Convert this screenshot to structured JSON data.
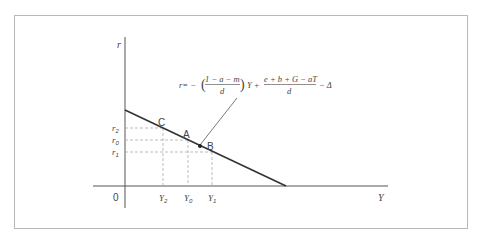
{
  "diagram": {
    "axes": {
      "y_label": "r",
      "x_label": "Y",
      "origin_label": "0"
    },
    "points": {
      "C": "C",
      "A": "A",
      "B": "B"
    },
    "y_ticks": [
      "r2",
      "r0",
      "r1"
    ],
    "y_ticks_display": {
      "r2_base": "r",
      "r2_sub": "2",
      "r0_base": "r",
      "r0_sub": "0",
      "r1_base": "r",
      "r1_sub": "1"
    },
    "x_ticks_display": {
      "Y2_base": "Y",
      "Y2_sub": "2",
      "Y0_base": "Y",
      "Y0_sub": "0",
      "Y1_base": "Y",
      "Y1_sub": "1"
    },
    "equation": {
      "lhs": "r= −",
      "frac1_num": "1 − a − m",
      "frac1_den": "d",
      "mid": "Y +",
      "frac2_num": "e + b + G − aT",
      "frac2_den": "d",
      "tail": "− Δ"
    },
    "colors": {
      "line": "#333333",
      "axis": "#555555",
      "dashed": "#aaaaaa",
      "frame": "#b8b8b8",
      "text": "#444444"
    }
  }
}
